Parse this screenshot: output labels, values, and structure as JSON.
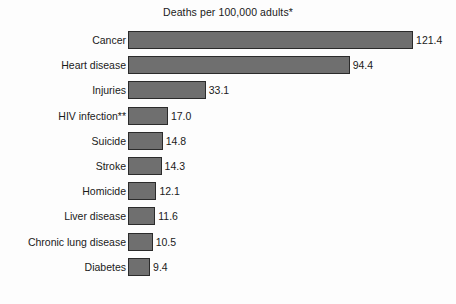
{
  "chart_data": {
    "type": "bar",
    "orientation": "horizontal",
    "title": "Deaths per 100,000 adults*",
    "xlabel": "",
    "ylabel": "",
    "grid": false,
    "legend": null,
    "xlim": [
      0,
      130
    ],
    "axis_visible": false,
    "bar_color": "#6f6f6f",
    "bar_edge_color": "#2b2b2b",
    "value_format": "one-decimal",
    "categories": [
      "Cancer",
      "Heart disease",
      "Injuries",
      "HIV infection**",
      "Suicide",
      "Stroke",
      "Homicide",
      "Liver disease",
      "Chronic lung disease",
      "Diabetes"
    ],
    "values": [
      121.4,
      94.4,
      33.1,
      17.0,
      14.8,
      14.3,
      12.1,
      11.6,
      10.5,
      9.4
    ],
    "value_labels": [
      "121.4",
      "94.4",
      "33.1",
      "17.0",
      "14.8",
      "14.3",
      "12.1",
      "11.6",
      "10.5",
      "9.4"
    ],
    "annotations": [
      "*",
      "**"
    ]
  }
}
